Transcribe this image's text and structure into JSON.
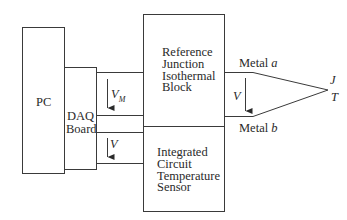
{
  "diagram": {
    "type": "thermocouple measurement block diagram",
    "pc": {
      "label": "PC"
    },
    "daq": {
      "label_line1": "DAQ",
      "label_line2": "Board"
    },
    "reference_block": {
      "label": "Reference\nJunction\nIsothermal\nBlock"
    },
    "sensor_block": {
      "label": "Integrated\nCircuit\nTemperature\nSensor"
    },
    "voltages": {
      "vm_symbol": "V",
      "vm_subscript": "M",
      "v_sensor": "V",
      "v_thermo": "V"
    },
    "wires": {
      "metal_a_prefix": "Metal ",
      "metal_a_var": "a",
      "metal_b_prefix": "Metal ",
      "metal_b_var": "b"
    },
    "junction": {
      "j_label": "J",
      "t_label": "T"
    },
    "colors": {
      "line": "#3a3a3a",
      "background": "#ffffff"
    }
  }
}
